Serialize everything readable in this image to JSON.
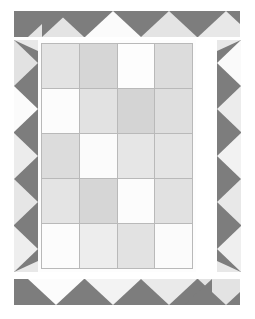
{
  "artwork": {
    "title": "Patchwork Quilt Pattern",
    "canvas": {
      "width": 255,
      "height": 319,
      "background": "#ffffff"
    },
    "palette": {
      "dark_gray": "#7d7d7d",
      "light_triangle": "#e8e8e8",
      "bright_triangle": "#fafafa",
      "gridline": "#b9b9b9",
      "white": "#fdfdfd",
      "pale": "#f4f4f4",
      "light": "#e9e9e9",
      "mid": "#dcdcdc",
      "gray": "#d2d2d2"
    },
    "borders": {
      "top": {
        "name": "top-sawtooth-border",
        "square_count": 8,
        "triangle_count": 4,
        "triangle_direction": "up",
        "square_color": "#7d7d7d",
        "triangle_colors": [
          "#e4e4e4",
          "#fbfbfb",
          "#e4e4e4",
          "#e8e8e8"
        ]
      },
      "bottom": {
        "name": "bottom-sawtooth-border",
        "square_count": 8,
        "triangle_count": 4,
        "triangle_direction": "down",
        "square_color": "#7d7d7d",
        "triangle_colors": [
          "#fcfcfc",
          "#f3f3f3",
          "#eaeaea",
          "#e3e3e3"
        ]
      },
      "left": {
        "name": "left-sawtooth-border",
        "square_count": 5,
        "triangle_direction": "right",
        "square_color": "#7d7d7d",
        "triangle_colors": [
          "#e2e2e2",
          "#fbfbfb",
          "#ececec",
          "#e6e6e6",
          "#eeeeee"
        ]
      },
      "right": {
        "name": "right-sawtooth-border",
        "square_count": 5,
        "triangle_direction": "left",
        "square_color": "#7d7d7d",
        "triangle_colors": [
          "#fafafa",
          "#ececec",
          "#f2f2f2",
          "#e8e8e8",
          "#efefef"
        ]
      }
    },
    "grid": {
      "name": "center-patch-grid",
      "columns": 4,
      "rows": 5,
      "gridline_color": "#b9b9b9",
      "cells": [
        [
          "#e3e3e3",
          "#d6d6d6",
          "#fdfdfd",
          "#dcdcdc"
        ],
        [
          "#fcfcfc",
          "#e2e2e2",
          "#d4d4d4",
          "#dedede"
        ],
        [
          "#dcdcdc",
          "#fbfbfb",
          "#e6e6e6",
          "#e4e4e4"
        ],
        [
          "#e4e4e4",
          "#d6d6d6",
          "#fcfcfc",
          "#e1e1e1"
        ],
        [
          "#fcfcfc",
          "#ededed",
          "#e2e2e2",
          "#fbfbfb"
        ]
      ]
    }
  }
}
